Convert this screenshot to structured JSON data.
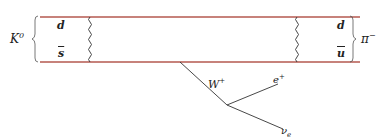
{
  "diagram": {
    "type": "feynman",
    "colors": {
      "quark_line": "#b5584f",
      "boson": "#333333",
      "lepton": "#333333"
    },
    "incoming": {
      "label": "K",
      "sup": "0",
      "quarks": [
        {
          "label": "d"
        },
        {
          "label": "s",
          "bar": true
        }
      ]
    },
    "outgoing": {
      "label": "π",
      "sup": "−",
      "quarks": [
        {
          "label": "d"
        },
        {
          "label": "u",
          "bar": true
        }
      ]
    },
    "boson": {
      "label": "W",
      "sup": "+"
    },
    "leptons": [
      {
        "label": "e",
        "sup": "+"
      },
      {
        "label": "ν",
        "sub": "e"
      }
    ]
  }
}
